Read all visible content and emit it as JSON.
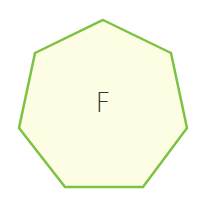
{
  "shape": {
    "type": "heptagon",
    "label": "F",
    "fill": "#FDFDE3",
    "stroke": "#7DC242",
    "stroke_width": 2.5,
    "points": "103,20 171,53 187,128 143,187 65,187 19,128 35,53",
    "label_color": "#333333",
    "label_x": 103,
    "label_y": 112,
    "label_size": 26
  }
}
